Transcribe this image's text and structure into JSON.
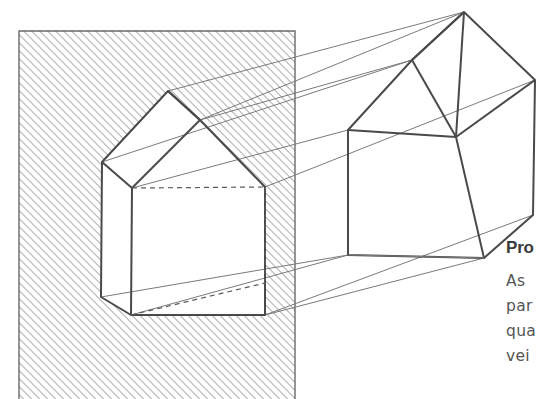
{
  "figure": {
    "name": "axonometric-projection-diagram",
    "type": "technical-line-drawing",
    "background_color": "#ffffff",
    "line_color": "#4a4a4a",
    "thin_line_color": "#6e6e6e",
    "hatch_color": "#8a8a8a"
  },
  "hatched_plane": {
    "label": "picture-plane",
    "x": 19,
    "y": 31,
    "width": 276,
    "height": 368,
    "hatch_angle_deg": 45,
    "hatch_spacing_px": 4,
    "border_color": "#6a6a6a"
  },
  "projected_house": {
    "label": "projected-house-outline",
    "apex": [
      168,
      91
    ],
    "ridge_front": [
      200,
      120
    ],
    "left_eave": [
      102,
      162
    ],
    "right_eave": [
      265,
      187
    ],
    "front_eave": [
      132,
      188
    ],
    "left_base": [
      101,
      297
    ],
    "front_base": [
      131,
      315
    ],
    "right_base": [
      265,
      315
    ]
  },
  "object_house": {
    "label": "object-house-outline",
    "apex": [
      464,
      12
    ],
    "rear_ridge": [
      412,
      60
    ],
    "right_eave": [
      535,
      80
    ],
    "left_eave": [
      348,
      130
    ],
    "front_eave": [
      456,
      137
    ],
    "right_lower": [
      533,
      215
    ],
    "left_base": [
      348,
      255
    ],
    "front_base": [
      484,
      258
    ]
  },
  "projection_rays": {
    "label": "projection-rays",
    "count": 6,
    "style": "thin-solid"
  },
  "hidden_edges": {
    "label": "hidden-edges",
    "style": "dashed",
    "count": 3
  },
  "caption": {
    "title": "Pro",
    "title_truncated": true,
    "body_lines": [
      "As",
      "par",
      "qua",
      "vei"
    ],
    "body_truncated": true,
    "title_color": "#3b3b3b",
    "body_color": "#555555"
  }
}
